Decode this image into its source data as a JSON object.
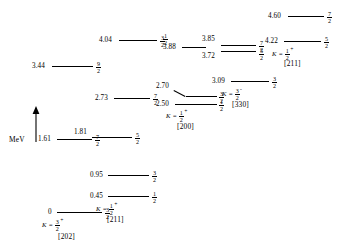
{
  "diagram": {
    "type": "nuclear-energy-level-diagram",
    "axis": {
      "label": "MeV",
      "arrow_direction": "up"
    },
    "bands": [
      {
        "id": "band-202",
        "k_prefix": "K =",
        "k_num": "3",
        "k_den": "2",
        "k_parity": "+",
        "nilsson": "[202]",
        "levels": [
          {
            "energy": "0",
            "spin_num": "3",
            "spin_den": "2"
          }
        ]
      },
      {
        "id": "band-211-low",
        "k_prefix": "K =",
        "k_num": "1",
        "k_den": "2",
        "k_parity": "+",
        "nilsson": "[211]",
        "levels": [
          {
            "energy": "0.45",
            "spin_num": "1",
            "spin_den": "2"
          },
          {
            "energy": "0.95",
            "spin_num": "3",
            "spin_den": "2"
          },
          {
            "energy": "1.81",
            "spin_num": "5",
            "spin_den": "2"
          }
        ]
      },
      {
        "id": "band-unassigned-left",
        "levels": [
          {
            "energy": "1.61",
            "spin_num": "7",
            "spin_den": "2"
          },
          {
            "energy": "3.44",
            "spin_num": "9",
            "spin_den": "2"
          }
        ]
      },
      {
        "id": "band-200",
        "k_prefix": "K =",
        "k_num": "1",
        "k_den": "2",
        "k_parity": "+",
        "nilsson": "[200]",
        "levels": [
          {
            "energy": "2.50",
            "spin_num": "1",
            "spin_den": "2"
          },
          {
            "energy": "2.70",
            "spin_num": "3",
            "spin_den": "2"
          },
          {
            "energy": "2.73",
            "spin_num": "7",
            "spin_den": "2"
          }
        ]
      },
      {
        "id": "band-330",
        "k_prefix": "K =",
        "k_num": "3",
        "k_den": "2",
        "k_parity": "-",
        "nilsson": "[330]",
        "levels": [
          {
            "energy": "3.09",
            "spin_num": "3",
            "spin_den": "2"
          },
          {
            "energy": "3.72",
            "spin_num": "5",
            "spin_den": "2"
          },
          {
            "energy": "3.85",
            "spin_num": "7",
            "spin_den": "2"
          }
        ]
      },
      {
        "id": "band-211-high",
        "k_prefix": "K =",
        "k_num": "1",
        "k_den": "2",
        "k_parity": "+",
        "nilsson": "[211]",
        "levels": [
          {
            "energy": "3.88",
            "spin_num": "1",
            "spin_den": "2"
          },
          {
            "energy": "4.04",
            "spin_num": "3",
            "spin_den": "2"
          },
          {
            "energy": "4.22",
            "spin_num": "5",
            "spin_den": "2"
          },
          {
            "energy": "4.60",
            "spin_num": "7",
            "spin_den": "2"
          }
        ]
      }
    ]
  }
}
